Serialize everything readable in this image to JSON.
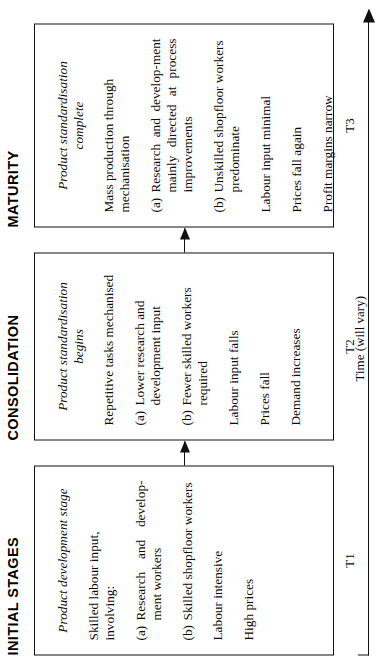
{
  "figure": {
    "orientation": "rotated-90-ccw",
    "time_axis": {
      "label": "Time (will vary)",
      "arrow": "arrow-right"
    },
    "time_marks": [
      "T1",
      "T2",
      "T3"
    ],
    "connectors": [
      "arrow-initial-to-consolidation",
      "arrow-consolidation-to-maturity"
    ]
  },
  "stages": [
    {
      "title": "INITIAL STAGES",
      "heading": "Product development stage",
      "lines": [
        "Skilled labour input, involving:"
      ],
      "items": [
        {
          "mark": "(a)",
          "text": "Research and develop-ment workers"
        },
        {
          "mark": "(b)",
          "text": "Skilled shopfloor workers"
        }
      ],
      "tail": [
        "Labour intensive",
        "High prices"
      ],
      "time_mark": "T1"
    },
    {
      "title": "CONSOLIDATION",
      "heading": "Product standardisation begins",
      "lines": [
        "Repetitive tasks mechanised"
      ],
      "items": [
        {
          "mark": "(a)",
          "text": "Lower research and development input"
        },
        {
          "mark": "(b)",
          "text": "Fewer skilled workers required"
        }
      ],
      "tail": [
        "Labour input falls",
        "Prices fall",
        "Demand increases"
      ],
      "time_mark": "T2"
    },
    {
      "title": "MATURITY",
      "heading": "Product standardisation complete",
      "lines": [
        "Mass production through mechanisation"
      ],
      "items": [
        {
          "mark": "(a)",
          "text": "Research and develop-ment mainly directed at process improvements"
        },
        {
          "mark": "(b)",
          "text": "Unskilled shopfloor workers predominate"
        }
      ],
      "tail": [
        "Labour input minimal",
        "Prices fall again",
        "Profit margins narrow"
      ],
      "time_mark": "T3"
    }
  ]
}
